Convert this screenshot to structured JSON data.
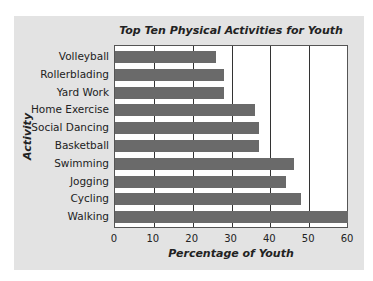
{
  "chart_data": {
    "type": "bar",
    "orientation": "horizontal",
    "title": "Top Ten Physical Activities for Youth",
    "xlabel": "Percentage of Youth",
    "ylabel": "Activity",
    "categories": [
      "Volleyball",
      "Rollerblading",
      "Yard Work",
      "Home Exercise",
      "Social Dancing",
      "Basketball",
      "Swimming",
      "Jogging",
      "Cycling",
      "Walking"
    ],
    "values": [
      26,
      28,
      28,
      36,
      37,
      37,
      46,
      44,
      48,
      60
    ],
    "xlim": [
      0,
      60
    ],
    "xticks": [
      "0",
      "10",
      "20",
      "30",
      "40",
      "50",
      "60"
    ],
    "grid": true,
    "legend": null,
    "bar_color": "#6a6a6a",
    "panel_color": "#e3e3e3"
  }
}
